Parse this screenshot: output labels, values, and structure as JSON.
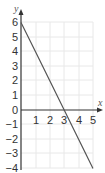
{
  "chart_data": {
    "type": "line",
    "title": "",
    "xlabel": "x",
    "ylabel": "y",
    "xlim": [
      0,
      5.3
    ],
    "ylim": [
      -4,
      6.5
    ],
    "grid": true,
    "x_ticks": [
      1,
      2,
      3,
      4,
      5
    ],
    "y_ticks": [
      6,
      5,
      4,
      3,
      2,
      1,
      0,
      -1,
      -2,
      -3,
      -4
    ],
    "x_tick_labels": [
      "1",
      "2",
      "3",
      "4",
      "5"
    ],
    "y_tick_labels": [
      "6",
      "5",
      "4",
      "3",
      "2",
      "1",
      "0",
      "−1",
      "−2",
      "−3",
      "−4"
    ],
    "series": [
      {
        "name": "y = 6 − 2x",
        "x": [
          0,
          1,
          2,
          3,
          4,
          5
        ],
        "y": [
          6,
          4,
          2,
          0,
          -2,
          -4
        ]
      }
    ],
    "legend": "none",
    "colors": {
      "line": "#555555",
      "axis": "#333333",
      "grid": "#e6e6e6"
    }
  }
}
